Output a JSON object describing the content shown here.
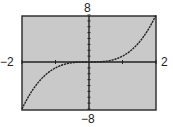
{
  "chart_data": {
    "type": "line",
    "title": "",
    "function": "y = x^3",
    "xlim": [
      -2,
      2
    ],
    "ylim": [
      -8,
      8
    ],
    "xscale": 1,
    "yscale": 1,
    "tick_labels": {
      "xmin": "−2",
      "xmax": "2",
      "ymax": "8",
      "ymin": "−8"
    },
    "x": [
      -2,
      -1.5,
      -1,
      -0.5,
      0,
      0.5,
      1,
      1.5,
      2
    ],
    "y": [
      -8,
      -3.375,
      -1,
      -0.125,
      0,
      0.125,
      1,
      3.375,
      8
    ],
    "grid": false,
    "background": "#c8c8c8",
    "line_color": "#222222"
  }
}
